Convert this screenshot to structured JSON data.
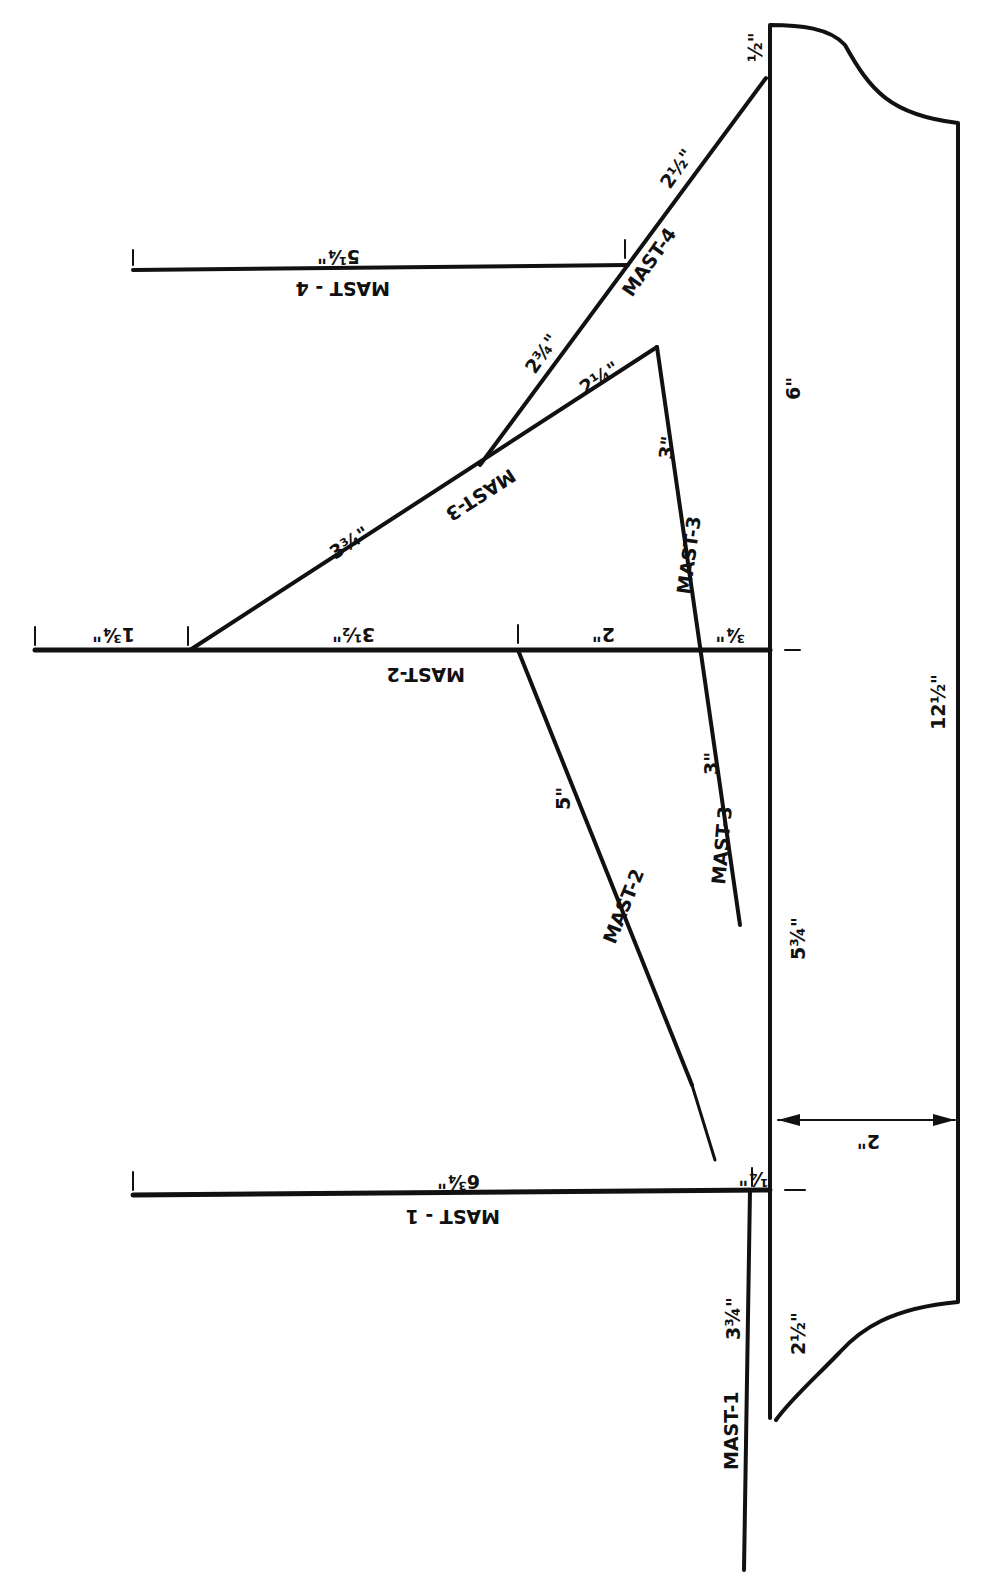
{
  "diagram": {
    "hull": {
      "length_label": "12½\"",
      "width_label": "2\"",
      "bow_offset_label": "½\"",
      "stern_label": "2½\"",
      "segment_a_label": "6\"",
      "segment_b_label": "5¾\""
    },
    "masts": {
      "mast4": {
        "name": "MAST-4",
        "horizontal_name": "MAST - 4",
        "length_label": "5¼\"",
        "stay_a": "2½\"",
        "stay_b": "2¾\""
      },
      "mast3": {
        "name": "MAST-3",
        "upper_label": "MAST-3",
        "lower_label": "MAST-3",
        "crossing_label": "MAST-3",
        "seg_a": "2¼\"",
        "seg_b": "3¾\"",
        "seg_c": "3\"",
        "seg_d": "3\"",
        "offset": "¾\""
      },
      "mast2": {
        "name": "MAST-2",
        "horizontal_name": "MAST-2",
        "seg_a": "1¾\"",
        "seg_b": "3½\"",
        "seg_c": "2\"",
        "stay_label": "5\"",
        "stay_name": "MAST-2"
      },
      "mast1": {
        "name": "MAST-1",
        "horizontal_name": "MAST - 1",
        "length_label": "6¾\"",
        "offset": "¼\"",
        "lower_label": "3¾\""
      }
    }
  }
}
